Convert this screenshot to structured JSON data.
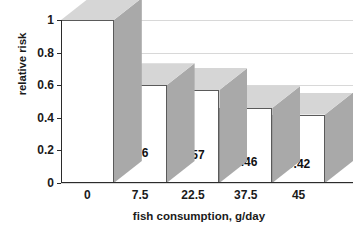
{
  "chart_data": {
    "type": "bar",
    "title": "",
    "xlabel": "fish consumption, g/day",
    "ylabel": "relative risk",
    "categories": [
      "0",
      "7.5",
      "22.5",
      "37.5",
      "45"
    ],
    "values": [
      1,
      0.6,
      0.57,
      0.46,
      0.42
    ],
    "data_labels": [
      "",
      "0.6",
      "0.57",
      "0.46",
      "0.42"
    ],
    "ylim": [
      0,
      1
    ],
    "yticks": [
      0,
      0.2,
      0.4,
      0.6,
      0.8,
      1
    ],
    "ytick_labels": [
      "0",
      "0.2",
      "0.4",
      "0.6",
      "0.8",
      "1"
    ],
    "grid": "horizontal",
    "legend": "none",
    "style": "3d-column",
    "colors": {
      "bar_front": "#ffffff",
      "bar_top": "#d6d6d6",
      "bar_side": "#a9a9a9",
      "bar_outline": "#5a5a5a",
      "axis": "#2b2b2b",
      "gridline": "#d8d8d8",
      "text": "#1a1a1a"
    }
  }
}
